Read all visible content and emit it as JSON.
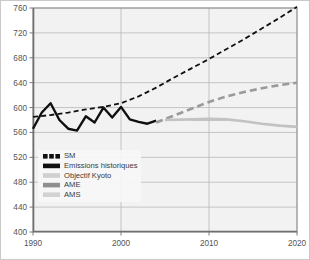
{
  "chart_data": {
    "type": "line",
    "title": "",
    "subtitle": "",
    "xlabel": "",
    "ylabel": "",
    "xlim": [
      1990,
      2020
    ],
    "ylim": [
      400,
      760
    ],
    "xticks": [
      1990,
      2000,
      2010,
      2020
    ],
    "yticks": [
      400,
      440,
      480,
      520,
      560,
      600,
      640,
      680,
      720,
      760
    ],
    "grid": "horizontal-and-vertical",
    "legend_position": "lower-left-inside",
    "series": [
      {
        "name": "SM",
        "style": "dashed",
        "color": "#101010",
        "width": 1.8,
        "x": [
          1990,
          1992,
          1994,
          1996,
          1998,
          2000,
          2002,
          2004,
          2006,
          2008,
          2010,
          2012,
          2014,
          2016,
          2018,
          2020
        ],
        "values": [
          585,
          588,
          592,
          597,
          601,
          607,
          618,
          632,
          648,
          663,
          678,
          694,
          710,
          727,
          744,
          762
        ]
      },
      {
        "name": "Emissions historiques",
        "style": "solid",
        "color": "#101010",
        "width": 2.4,
        "x": [
          1990,
          1991,
          1992,
          1993,
          1994,
          1995,
          1996,
          1997,
          1998,
          1999,
          2000,
          2001,
          2002,
          2003,
          2004
        ],
        "values": [
          566,
          592,
          607,
          580,
          566,
          563,
          586,
          576,
          600,
          584,
          601,
          581,
          577,
          574,
          579
        ]
      },
      {
        "name": "Objectif Kyoto",
        "style": "solid",
        "color": "#b5b5b5",
        "width": 2.6,
        "x": [
          2008,
          2012
        ],
        "values": [
          581,
          581
        ]
      },
      {
        "name": "AME",
        "style": "dashed",
        "color": "#9a9a9a",
        "width": 2.6,
        "x": [
          2004,
          2006,
          2008,
          2010,
          2012,
          2014,
          2016,
          2018,
          2020
        ],
        "values": [
          576,
          587,
          598,
          609,
          618,
          625,
          631,
          636,
          640
        ]
      },
      {
        "name": "AMS",
        "style": "solid",
        "color": "#c2c2c2",
        "width": 2.6,
        "x": [
          2005,
          2008,
          2010,
          2012,
          2014,
          2016,
          2018,
          2020
        ],
        "values": [
          580,
          581,
          582,
          581,
          578,
          574,
          571,
          569
        ]
      }
    ],
    "legend": [
      {
        "label": "SM",
        "swatch": "dashed-black"
      },
      {
        "label": "Emissions historiques",
        "swatch": "solid-black"
      },
      {
        "label": "Objectif Kyoto",
        "swatch": "solid-lightgray"
      },
      {
        "label": "AME",
        "swatch": "solid-darkgray"
      },
      {
        "label": "AMS",
        "swatch": "solid-lightgray2"
      }
    ],
    "colors": {
      "plot_background": "#f2f2f2",
      "grid": "#b9b9b9",
      "axis": "#7a7a7a",
      "page_background": "#ffffff",
      "page_border": "#c9c9c9",
      "tick_text": "#555555",
      "legend_background": "#f7f7f7"
    }
  }
}
